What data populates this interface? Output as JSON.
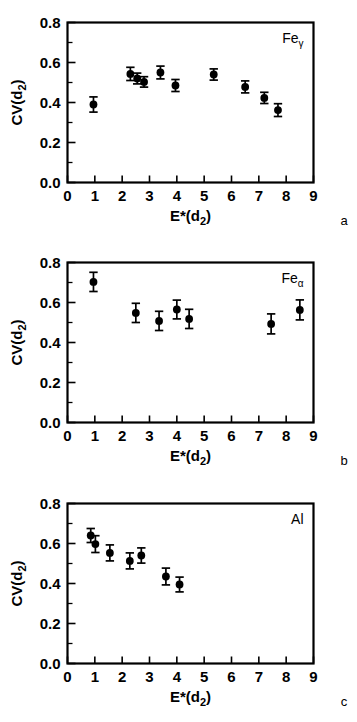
{
  "figure": {
    "panels": [
      {
        "id": "a",
        "letter": "a",
        "series_label_base": "Fe",
        "series_label_sub": "γ",
        "chart_data": {
          "type": "scatter",
          "title": "Feγ",
          "xlabel_base": "E*(d",
          "xlabel_sub": "2",
          "xlabel_close": ")",
          "ylabel_base": "CV(d",
          "ylabel_sub": "2",
          "ylabel_close": ")",
          "xlim": [
            0,
            9
          ],
          "ylim": [
            0.0,
            0.8
          ],
          "xticks": [
            0,
            1,
            2,
            3,
            4,
            5,
            6,
            7,
            8,
            9
          ],
          "xticklabels": [
            "0",
            "1",
            "2",
            "3",
            "4",
            "5",
            "6",
            "7",
            "8",
            "9"
          ],
          "yticks": [
            0.0,
            0.2,
            0.4,
            0.6,
            0.8
          ],
          "yticklabels": [
            "0.0",
            "0.2",
            "0.4",
            "0.6",
            "0.8"
          ],
          "yminorticks": [
            0.1,
            0.3,
            0.5,
            0.7
          ],
          "grid": false,
          "legend": "none",
          "marker": "filled-circle",
          "errorbars": "vertical-symmetric",
          "points": [
            {
              "x": 0.95,
              "y": 0.39,
              "yerr": 0.038
            },
            {
              "x": 2.3,
              "y": 0.543,
              "yerr": 0.033
            },
            {
              "x": 2.55,
              "y": 0.52,
              "yerr": 0.027
            },
            {
              "x": 2.8,
              "y": 0.503,
              "yerr": 0.026
            },
            {
              "x": 3.4,
              "y": 0.55,
              "yerr": 0.032
            },
            {
              "x": 3.95,
              "y": 0.485,
              "yerr": 0.03
            },
            {
              "x": 5.35,
              "y": 0.54,
              "yerr": 0.028
            },
            {
              "x": 6.5,
              "y": 0.478,
              "yerr": 0.03
            },
            {
              "x": 7.2,
              "y": 0.423,
              "yerr": 0.028
            },
            {
              "x": 7.7,
              "y": 0.362,
              "yerr": 0.032
            }
          ]
        }
      },
      {
        "id": "b",
        "letter": "b",
        "series_label_base": "Fe",
        "series_label_sub": "α",
        "chart_data": {
          "type": "scatter",
          "title": "Feα",
          "xlabel_base": "E*(d",
          "xlabel_sub": "2",
          "xlabel_close": ")",
          "ylabel_base": "CV(d",
          "ylabel_sub": "2",
          "ylabel_close": ")",
          "xlim": [
            0,
            9
          ],
          "ylim": [
            0.0,
            0.8
          ],
          "xticks": [
            0,
            1,
            2,
            3,
            4,
            5,
            6,
            7,
            8,
            9
          ],
          "xticklabels": [
            "0",
            "1",
            "2",
            "3",
            "4",
            "5",
            "6",
            "7",
            "8",
            "9"
          ],
          "yticks": [
            0.0,
            0.2,
            0.4,
            0.6,
            0.8
          ],
          "yticklabels": [
            "0.0",
            "0.2",
            "0.4",
            "0.6",
            "0.8"
          ],
          "yminorticks": [
            0.1,
            0.3,
            0.5,
            0.7
          ],
          "grid": false,
          "legend": "none",
          "marker": "filled-circle",
          "errorbars": "vertical-symmetric",
          "points": [
            {
              "x": 0.95,
              "y": 0.703,
              "yerr": 0.048
            },
            {
              "x": 2.5,
              "y": 0.548,
              "yerr": 0.048
            },
            {
              "x": 3.35,
              "y": 0.508,
              "yerr": 0.048
            },
            {
              "x": 4.0,
              "y": 0.565,
              "yerr": 0.047
            },
            {
              "x": 4.45,
              "y": 0.518,
              "yerr": 0.048
            },
            {
              "x": 7.45,
              "y": 0.493,
              "yerr": 0.05
            },
            {
              "x": 8.5,
              "y": 0.563,
              "yerr": 0.05
            }
          ]
        }
      },
      {
        "id": "c",
        "letter": "c",
        "series_label_base": "Al",
        "series_label_sub": "",
        "chart_data": {
          "type": "scatter",
          "title": "Al",
          "xlabel_base": "E*(d",
          "xlabel_sub": "2",
          "xlabel_close": ")",
          "ylabel_base": "CV(d",
          "ylabel_sub": "2",
          "ylabel_close": ")",
          "xlim": [
            0,
            9
          ],
          "ylim": [
            0.0,
            0.8
          ],
          "xticks": [
            0,
            1,
            2,
            3,
            4,
            5,
            6,
            7,
            8,
            9
          ],
          "xticklabels": [
            "0",
            "1",
            "2",
            "3",
            "4",
            "5",
            "6",
            "7",
            "8",
            "9"
          ],
          "yticks": [
            0.0,
            0.2,
            0.4,
            0.6,
            0.8
          ],
          "yticklabels": [
            "0.0",
            "0.2",
            "0.4",
            "0.6",
            "0.8"
          ],
          "yminorticks": [
            0.1,
            0.3,
            0.5,
            0.7
          ],
          "grid": false,
          "legend": "none",
          "marker": "filled-circle",
          "errorbars": "vertical-symmetric",
          "points": [
            {
              "x": 0.85,
              "y": 0.64,
              "yerr": 0.035
            },
            {
              "x": 1.02,
              "y": 0.597,
              "yerr": 0.042
            },
            {
              "x": 1.55,
              "y": 0.553,
              "yerr": 0.04
            },
            {
              "x": 2.28,
              "y": 0.513,
              "yerr": 0.04
            },
            {
              "x": 2.7,
              "y": 0.54,
              "yerr": 0.038
            },
            {
              "x": 3.6,
              "y": 0.435,
              "yerr": 0.042
            },
            {
              "x": 4.1,
              "y": 0.395,
              "yerr": 0.037
            }
          ]
        }
      }
    ]
  }
}
